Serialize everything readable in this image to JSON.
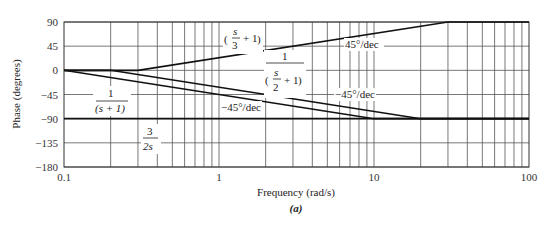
{
  "chart_data": {
    "type": "line",
    "title": "",
    "caption": "(a)",
    "xlabel": "Frequency (rad/s)",
    "ylabel": "Phase (degrees)",
    "xscale": "log",
    "xlim": [
      0.1,
      100
    ],
    "ylim": [
      -180,
      90
    ],
    "x_ticks": [
      "0.1",
      "1",
      "10",
      "100"
    ],
    "y_ticks": [
      "90",
      "45",
      "0",
      "-45",
      "-90",
      "-135",
      "-180"
    ],
    "grid": true,
    "series": [
      {
        "name": "(s/3 + 1)",
        "x": [
          0.1,
          0.3,
          30,
          100
        ],
        "y": [
          0,
          0,
          90,
          90
        ]
      },
      {
        "name": "1/(s/2 + 1)",
        "x": [
          0.1,
          0.2,
          20,
          100
        ],
        "y": [
          0,
          0,
          -90,
          -90
        ]
      },
      {
        "name": "1/(s + 1)",
        "x": [
          0.1,
          10,
          100
        ],
        "y": [
          0,
          -90,
          -90
        ]
      },
      {
        "name": "3/(2s)",
        "x": [
          0.1,
          100
        ],
        "y": [
          -90,
          -90
        ]
      }
    ],
    "annotations": [
      {
        "text": "45°/dec",
        "near": "(s/3 + 1)"
      },
      {
        "text": "−45°/dec",
        "near": "1/(s/2 + 1)"
      },
      {
        "text": "−45°/dec",
        "near": "1/(s + 1)"
      }
    ],
    "labels": {
      "s3": {
        "num": "s",
        "den": "3",
        "plus": "+ 1"
      },
      "s2": {
        "top": "1",
        "num": "s",
        "den": "2",
        "plus": "+ 1"
      },
      "s1": {
        "top": "1",
        "bottom": "(s + 1)"
      },
      "s0": {
        "num": "3",
        "den": "2s"
      }
    }
  }
}
